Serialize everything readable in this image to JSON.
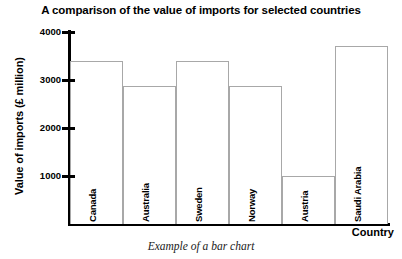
{
  "chart_data": {
    "type": "bar",
    "title": "A comparison of the value of imports for selected countries",
    "xlabel": "Country",
    "ylabel": "Value of imports (£ million)",
    "categories": [
      "Canada",
      "Australia",
      "Sweden",
      "Norway",
      "Austria",
      "Saudi Arabia"
    ],
    "values": [
      3400,
      2880,
      3400,
      2880,
      1000,
      3700
    ],
    "ylim": [
      0,
      4000
    ],
    "yticks": [
      1000,
      2000,
      3000,
      4000
    ],
    "ytick_labels": [
      "1000",
      "2000",
      "3000",
      "4000"
    ],
    "grid": false,
    "legend": false,
    "bar_fill": "#ffffff",
    "bar_border": "#a8a8a8",
    "axis_color": "#000000"
  },
  "caption": "Example of a bar chart"
}
